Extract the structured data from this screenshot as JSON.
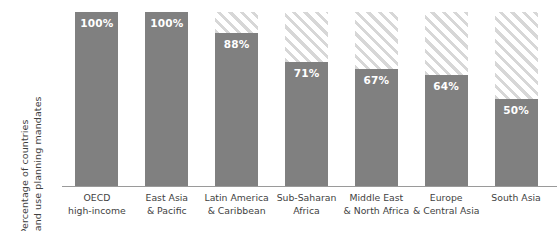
{
  "chart_data": {
    "type": "bar",
    "title": "",
    "subtitle": "",
    "xlabel": "",
    "ylabel": "Percentage of countries with land use planning mandates",
    "ylabel_line1": "Percentage of countries",
    "ylabel_line2": "with land use planning mandates",
    "ylim": [
      0,
      100
    ],
    "grid": false,
    "legend_position": "none",
    "value_suffix": "%",
    "categories": [
      "OECD high-income",
      "East Asia & Pacific",
      "Latin America & Caribbean",
      "Sub-Saharan Africa",
      "Middle East & North Africa",
      "Europe & Central Asia",
      "South Asia"
    ],
    "category_lines": [
      [
        "OECD",
        "high-income"
      ],
      [
        "East Asia",
        "& Pacific"
      ],
      [
        "Latin America",
        "& Caribbean"
      ],
      [
        "Sub-Saharan",
        "Africa"
      ],
      [
        "Middle East",
        "& North Africa"
      ],
      [
        "Europe",
        "& Central Asia"
      ],
      [
        "South Asia"
      ]
    ],
    "values": [
      100,
      100,
      88,
      71,
      67,
      64,
      50
    ],
    "value_labels": [
      "100%",
      "100%",
      "88%",
      "71%",
      "67%",
      "64%",
      "50%"
    ],
    "remainder_values": [
      0,
      0,
      12,
      29,
      33,
      36,
      50
    ],
    "colors": {
      "bar_fill": "#808080",
      "hatch_stripe": "#d7d7d7",
      "hatch_background": "#ffffff",
      "value_label": "#ffffff",
      "axis_line": "#9a9a9a",
      "tick_label": "#3f3f3f",
      "background": "#ffffff"
    }
  }
}
